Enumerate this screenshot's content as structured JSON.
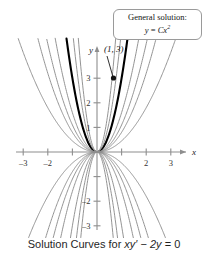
{
  "caption": {
    "prefix": "Solution Curves for ",
    "equation_lhs": "xy′",
    "equation_mid": " − ",
    "equation_rhs": "2y",
    "equation_end": " = 0",
    "full": "Solution Curves for xy′ − 2y = 0"
  },
  "callout": {
    "line1": "General solution:",
    "line2_lhs": "y",
    "line2_eq": " = ",
    "line2_coef": "C",
    "line2_var": "x",
    "line2_exp": "2",
    "full": "General solution: y = Cx²"
  },
  "point_label": "(1, 3)",
  "axes": {
    "x_axis_label": "x",
    "y_axis_label": "y",
    "x_ticks": [
      -3,
      -2,
      -1,
      1,
      2,
      3
    ],
    "x_tick_labels": [
      "–3",
      "–2",
      "",
      "",
      "2",
      "3"
    ],
    "y_ticks": [
      -3,
      -2,
      -1,
      1,
      2,
      3
    ],
    "y_tick_labels": [
      "–3",
      "–2",
      "",
      "1",
      "2",
      "3"
    ]
  },
  "colors": {
    "curve_gray": "#8e8e8e",
    "curve_highlight": "#000000",
    "axis": "#8e8e8e",
    "tick_text": "#333333",
    "callout_border": "#9a9a9a",
    "background": "#ffffff"
  },
  "chart_data": {
    "type": "line",
    "title": "Solution Curves for xy′ − 2y = 0",
    "xlabel": "x",
    "ylabel": "y",
    "xlim": [
      -3.8,
      3.8
    ],
    "ylim": [
      -3.8,
      4.0
    ],
    "grid": false,
    "legend": "none",
    "family_equation": "y = Cx^2",
    "annotations": [
      {
        "text": "General solution: y = Cx²",
        "type": "callout-box",
        "x": 2.2,
        "y": 3.8
      },
      {
        "text": "(1, 3)",
        "type": "point-label",
        "x": 1.0,
        "y": 3.0
      }
    ],
    "marked_points": [
      {
        "x": 1,
        "y": 3,
        "label": "(1, 3)"
      }
    ],
    "series": [
      {
        "name": "C = 3 (particular solution)",
        "C": 3,
        "highlight": true
      },
      {
        "name": "C = 8",
        "C": 8,
        "highlight": false
      },
      {
        "name": "C = 1.6",
        "C": 1.6,
        "highlight": false
      },
      {
        "name": "C = 0.8",
        "C": 0.8,
        "highlight": false
      },
      {
        "name": "C = 0.45",
        "C": 0.45,
        "highlight": false
      },
      {
        "name": "C = 5",
        "C": 5,
        "highlight": false
      },
      {
        "name": "C = 1.1",
        "C": 1.1,
        "highlight": false
      },
      {
        "name": "C = -8",
        "C": -8,
        "highlight": false
      },
      {
        "name": "C = -5",
        "C": -5,
        "highlight": false
      },
      {
        "name": "C = -3",
        "C": -3,
        "highlight": false
      },
      {
        "name": "C = -1.6",
        "C": -1.6,
        "highlight": false
      },
      {
        "name": "C = -1.1",
        "C": -1.1,
        "highlight": false
      },
      {
        "name": "C = -0.8",
        "C": -0.8,
        "highlight": false
      },
      {
        "name": "C = -0.45",
        "C": -0.45,
        "highlight": false
      }
    ]
  }
}
